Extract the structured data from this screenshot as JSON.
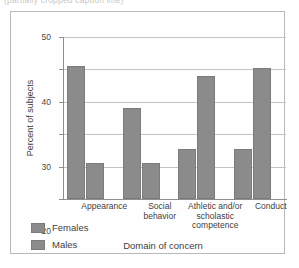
{
  "caption": {
    "clipped_top_text": "(partially cropped caption line)"
  },
  "chart_data": {
    "type": "bar",
    "title": "",
    "xlabel": "Domain of concern",
    "ylabel": "Percent of subjects",
    "ylim": [
      0,
      50
    ],
    "yticks": [
      0,
      10,
      20,
      30,
      40,
      50
    ],
    "ytick_labels": [
      "0",
      "10",
      "20",
      "30",
      "40",
      "50"
    ],
    "grid": true,
    "legend_position": "bottom-left",
    "categories": [
      "Appearance",
      "Social\nbehavior",
      "Athletic and/or\nscholastic\ncompetence",
      "Conduct"
    ],
    "series": [
      {
        "name": "Females",
        "color": "#8b8b8b",
        "values": [
          41,
          28,
          15.5,
          15.5
        ]
      },
      {
        "name": "Males",
        "color": "#8b8b8b",
        "values": [
          11,
          11,
          38,
          40.5
        ]
      }
    ]
  }
}
